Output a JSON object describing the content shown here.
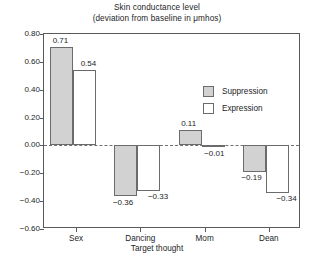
{
  "chart_data": {
    "type": "bar",
    "title": "Skin conductance level",
    "subtitle": "(deviation from baseline in μmhos)",
    "xlabel": "Target thought",
    "ylabel": "",
    "categories": [
      "Sex",
      "Dancing",
      "Mom",
      "Dean"
    ],
    "series": [
      {
        "name": "Suppression",
        "color": "#d2d2d2",
        "values": [
          0.71,
          -0.36,
          0.11,
          -0.19
        ],
        "labels": [
          "0.71",
          "−0.36",
          "0.11",
          "−0.19"
        ]
      },
      {
        "name": "Expression",
        "color": "#ffffff",
        "values": [
          0.54,
          -0.33,
          -0.01,
          -0.34
        ],
        "labels": [
          "0.54",
          "−0.33",
          "−0.01",
          "−0.34"
        ]
      }
    ],
    "ylim": [
      -0.6,
      0.8
    ],
    "ytick_labels": [
      "0.80",
      "0.60",
      "0.40",
      "0.20",
      "0.00",
      "−0.20",
      "−0.40",
      "−0.60"
    ],
    "ytick_values": [
      0.8,
      0.6,
      0.4,
      0.2,
      0.0,
      -0.2,
      -0.4,
      -0.6
    ],
    "grid": false,
    "zero_line": true,
    "legend_position": "upper-right-inside"
  },
  "legend": {
    "items": [
      {
        "label": "Suppression",
        "swatch": "suppression"
      },
      {
        "label": "Expression",
        "swatch": "expression"
      }
    ]
  }
}
